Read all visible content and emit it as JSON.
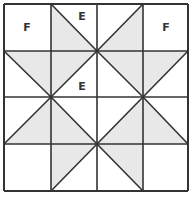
{
  "diagram": {
    "grid": {
      "rows": 4,
      "cols": 4,
      "x_lines": [
        4,
        51,
        97,
        143,
        188
      ],
      "y_lines": [
        4,
        51,
        97,
        144,
        191
      ]
    },
    "colors": {
      "line": "#333333",
      "shade": "#e8e8e8",
      "background": "#ffffff"
    },
    "labels": [
      {
        "id": "f-top-left",
        "text": "F",
        "x": 27,
        "y": 31
      },
      {
        "id": "e-top",
        "text": "E",
        "x": 82,
        "y": 20
      },
      {
        "id": "f-top-right",
        "text": "F",
        "x": 166,
        "y": 31
      },
      {
        "id": "e-center",
        "text": "E",
        "x": 82,
        "y": 90
      }
    ],
    "shaded_triangles": [
      "51,4 51,51 97,51",
      "97,51 143,4 143,51",
      "4,51 51,51 51,97",
      "51,51 97,51 51,97",
      "97,51 143,51 143,97",
      "143,51 188,51 143,97",
      "51,97 51,144 4,144",
      "51,97 51,144 97,144",
      "97,144 143,97 143,144",
      "143,97 143,144 188,144",
      "51,144 97,144 51,191",
      "97,144 143,144 143,191"
    ],
    "diagonals": [
      "51,4 97,51",
      "97,51 143,4",
      "4,51 51,97",
      "51,97 97,51",
      "97,51 143,97",
      "143,97 188,51",
      "4,144 51,97",
      "51,97 97,144",
      "97,144 143,97",
      "143,97 188,144",
      "51,191 97,144",
      "97,144 143,191"
    ]
  }
}
